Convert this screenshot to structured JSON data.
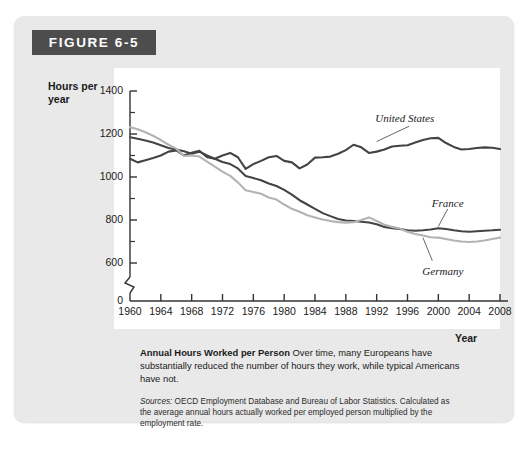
{
  "figure": {
    "banner_label": "FIGURE 6-5",
    "caption_title": "Annual Hours Worked per Person",
    "caption_body": "Over time, many Europeans have substantially reduced the number of hours they work, while typical Americans have not.",
    "sources_label": "Sources:",
    "sources_body": "OECD Employment Database and Bureau of Labor Statistics. Calculated as the average annual hours actually worked per employed person multiplied by the employment rate."
  },
  "colors": {
    "banner_bg": "#4d4d4d",
    "card_bg": "#e9e9e9",
    "plot_bg": "#ffffff",
    "axis": "#333333",
    "united_states": "#444444",
    "france": "#444444",
    "germany": "#b3b3b3"
  },
  "chart_data": {
    "type": "line",
    "title": "Annual Hours Worked per Person",
    "xlabel": "Year",
    "ylabel": "Hours per year",
    "xlim": [
      1960,
      2008
    ],
    "ylim": [
      540,
      1400
    ],
    "axis_break": true,
    "grid": false,
    "legend_position": "inline-annotations",
    "ytick_labels": [
      "0",
      "600",
      "800",
      "1000",
      "1200",
      "1400"
    ],
    "ytick_values": [
      0,
      600,
      800,
      1000,
      1200,
      1400
    ],
    "yminor_values": [
      700,
      900,
      1100,
      1300
    ],
    "xtick_labels": [
      "1960",
      "1964",
      "1968",
      "1972",
      "1976",
      "1980",
      "1984",
      "1988",
      "1992",
      "1996",
      "2000",
      "2004",
      "2008"
    ],
    "xtick_values": [
      1960,
      1964,
      1968,
      1972,
      1976,
      1980,
      1984,
      1988,
      1992,
      1996,
      2000,
      2004,
      2008
    ],
    "x": [
      1960,
      1961,
      1962,
      1963,
      1964,
      1965,
      1966,
      1967,
      1968,
      1969,
      1970,
      1971,
      1972,
      1973,
      1974,
      1975,
      1976,
      1977,
      1978,
      1979,
      1980,
      1981,
      1982,
      1983,
      1984,
      1985,
      1986,
      1987,
      1988,
      1989,
      1990,
      1991,
      1992,
      1993,
      1994,
      1995,
      1996,
      1997,
      1998,
      1999,
      2000,
      2001,
      2002,
      2003,
      2004,
      2005,
      2006,
      2007,
      2008
    ],
    "series": [
      {
        "name": "United States",
        "color": "#444444",
        "values": [
          1085,
          1068,
          1078,
          1088,
          1100,
          1118,
          1124,
          1100,
          1113,
          1122,
          1092,
          1085,
          1100,
          1112,
          1092,
          1038,
          1060,
          1075,
          1092,
          1098,
          1075,
          1068,
          1040,
          1058,
          1090,
          1092,
          1095,
          1108,
          1125,
          1150,
          1138,
          1112,
          1118,
          1128,
          1142,
          1145,
          1148,
          1160,
          1172,
          1180,
          1182,
          1158,
          1140,
          1128,
          1130,
          1135,
          1138,
          1136,
          1130
        ]
      },
      {
        "name": "France",
        "color": "#444444",
        "values": [
          1185,
          1178,
          1170,
          1160,
          1148,
          1135,
          1128,
          1120,
          1108,
          1118,
          1100,
          1085,
          1070,
          1060,
          1040,
          1005,
          995,
          985,
          970,
          958,
          940,
          918,
          892,
          872,
          852,
          832,
          818,
          805,
          798,
          795,
          792,
          788,
          780,
          768,
          762,
          758,
          752,
          750,
          752,
          756,
          762,
          758,
          752,
          748,
          745,
          748,
          750,
          752,
          755
        ]
      },
      {
        "name": "Germany",
        "color": "#b3b3b3",
        "values": [
          1232,
          1222,
          1208,
          1192,
          1172,
          1150,
          1132,
          1098,
          1100,
          1095,
          1072,
          1048,
          1025,
          1005,
          975,
          938,
          930,
          922,
          905,
          895,
          872,
          852,
          838,
          822,
          812,
          802,
          795,
          790,
          788,
          790,
          800,
          812,
          795,
          778,
          768,
          760,
          745,
          735,
          728,
          720,
          718,
          712,
          705,
          700,
          698,
          700,
          705,
          712,
          718
        ]
      }
    ],
    "annotations": [
      {
        "label": "United States",
        "x": 1997,
        "y": 1255
      },
      {
        "label": "France",
        "x": 2002,
        "y": 870
      },
      {
        "label": "Germany",
        "x": 2000,
        "y": 620
      }
    ]
  }
}
